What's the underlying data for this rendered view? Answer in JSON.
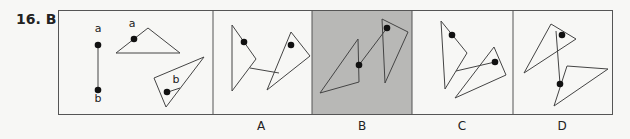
{
  "question": {
    "number": "16.",
    "answer": "B",
    "title": "16.  B"
  },
  "colors": {
    "border": "#555555",
    "shaded": "#b8b8b6",
    "background": "#f7f7f5",
    "line": "#444444",
    "dot": "#111111"
  },
  "example": {
    "point_a_label": "a",
    "point_b_label": "b",
    "triangle_a_label": "a",
    "triangle_b_label": "b"
  },
  "options": [
    {
      "label": "A",
      "selected": false
    },
    {
      "label": "B",
      "selected": true
    },
    {
      "label": "C",
      "selected": false
    },
    {
      "label": "D",
      "selected": false
    }
  ]
}
